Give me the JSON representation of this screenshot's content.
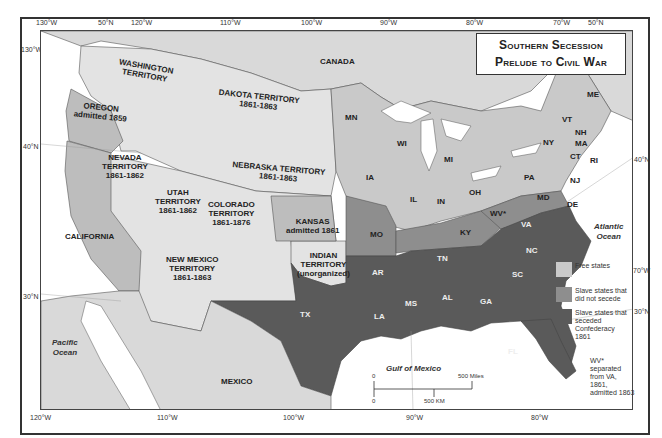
{
  "title": {
    "line1": "Southern Secession",
    "line2": "Prelude to Civil War"
  },
  "colors": {
    "free": "#c9c9c9",
    "slave_not_seceded": "#8e8e8e",
    "seceded": "#5a5a5a",
    "territory": "#e3e3e3",
    "water": "#ffffff",
    "foreign": "#d9d9d9"
  },
  "top_ticks": [
    "130°W",
    "50°N",
    "120°W",
    "110°W",
    "100°W",
    "90°W",
    "80°W",
    "70°W",
    "50°N"
  ],
  "bottom_ticks": [
    "120°W",
    "110°W",
    "100°W",
    "90°W",
    "80°W"
  ],
  "left_ticks": [
    "130°W",
    "40°N",
    "30°N"
  ],
  "right_ticks": [
    "40°N",
    "70°W",
    "30°N"
  ],
  "regions": {
    "canada": "CANADA",
    "mexico": "MEXICO",
    "washington": [
      "WASHINGTON",
      "TERRITORY"
    ],
    "oregon": [
      "OREGON",
      "admitted 1859"
    ],
    "dakota": [
      "DAKOTA TERRITORY",
      "1861-1863"
    ],
    "nebraska": [
      "NEBRASKA TERRITORY",
      "1861-1863"
    ],
    "nevada": [
      "NEVADA",
      "TERRITORY",
      "1861-1862"
    ],
    "utah": [
      "UTAH",
      "TERRITORY",
      "1861-1862"
    ],
    "colorado": [
      "COLORADO",
      "TERRITORY",
      "1861-1876"
    ],
    "california": "CALIFORNIA",
    "kansas": [
      "KANSAS",
      "admitted 1861"
    ],
    "new_mexico": [
      "NEW MEXICO",
      "TERRITORY",
      "1861-1863"
    ],
    "indian": [
      "INDIAN",
      "TERRITORY",
      "(unorganized)"
    ]
  },
  "states": {
    "free": [
      "MN",
      "WI",
      "MI",
      "IA",
      "IL",
      "IN",
      "OH",
      "PA",
      "NY",
      "VT",
      "NH",
      "ME",
      "MA",
      "CT",
      "RI",
      "NJ"
    ],
    "slave_not_seceded": [
      "MO",
      "KY",
      "WV*",
      "MD",
      "DE"
    ],
    "seceded": [
      "TX",
      "AR",
      "LA",
      "MS",
      "AL",
      "TN",
      "GA",
      "SC",
      "NC",
      "VA",
      "FL"
    ]
  },
  "oceans": {
    "pacific": [
      "Pacific",
      "Ocean"
    ],
    "atlantic": [
      "Atlantic",
      "Ocean"
    ],
    "gulf": "Gulf of Mexico"
  },
  "legend": [
    {
      "label": "Free states",
      "color": "#c9c9c9"
    },
    {
      "label": "Slave states that did not secede",
      "color": "#8e8e8e"
    },
    {
      "label": "Slave states that seceded Confederacy 1861",
      "color": "#5a5a5a"
    }
  ],
  "note": "WV* separated from VA, 1861, admitted 1863",
  "scale": {
    "zero_top": "0",
    "miles": "500 Miles",
    "zero_bottom": "0",
    "km": "500 KM"
  }
}
